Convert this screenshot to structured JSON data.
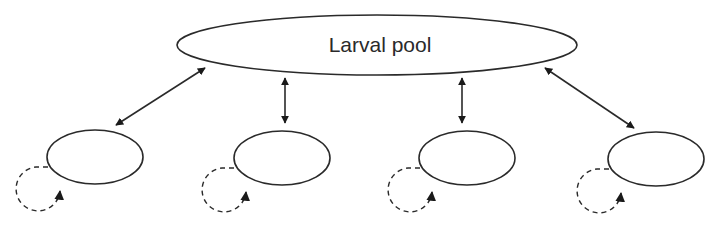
{
  "diagram": {
    "pool": {
      "label": "Larval pool",
      "cx": 377,
      "cy": 45,
      "rx": 200,
      "ry": 30
    },
    "populations": [
      {
        "id": "population-1",
        "cx": 95,
        "cy": 157,
        "rx": 48,
        "ry": 27
      },
      {
        "id": "population-2",
        "cx": 282,
        "cy": 158,
        "rx": 48,
        "ry": 27
      },
      {
        "id": "population-3",
        "cx": 467,
        "cy": 158,
        "rx": 48,
        "ry": 27
      },
      {
        "id": "population-4",
        "cx": 656,
        "cy": 159,
        "rx": 48,
        "ry": 27
      }
    ],
    "edges": [
      {
        "from": "pool",
        "to": "population-1",
        "type": "bidirectional"
      },
      {
        "from": "pool",
        "to": "population-2",
        "type": "bidirectional"
      },
      {
        "from": "pool",
        "to": "population-3",
        "type": "bidirectional"
      },
      {
        "from": "pool",
        "to": "population-4",
        "type": "bidirectional"
      },
      {
        "from": "population-1",
        "to": "population-1",
        "type": "self-loop-dashed"
      },
      {
        "from": "population-2",
        "to": "population-2",
        "type": "self-loop-dashed"
      },
      {
        "from": "population-3",
        "to": "population-3",
        "type": "self-loop-dashed"
      },
      {
        "from": "population-4",
        "to": "population-4",
        "type": "self-loop-dashed"
      }
    ],
    "colors": {
      "stroke": "#2a2a2a",
      "background": "#ffffff"
    }
  }
}
